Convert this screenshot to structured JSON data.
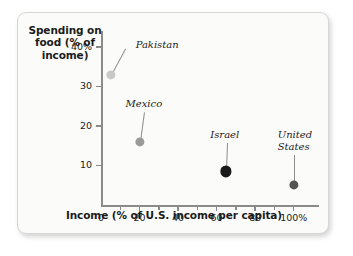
{
  "chart_data": {
    "type": "scatter",
    "title": "",
    "xlabel": "Income (% of U.S. income per capita)",
    "ylabel": "Spending on food (% of income)",
    "ylabel_lines": [
      "Spending on",
      "food (% of",
      "income)"
    ],
    "xlim": [
      0,
      110
    ],
    "ylim": [
      0,
      43
    ],
    "grid": false,
    "legend": "none",
    "x_ticks": [
      {
        "value": 0,
        "label": "0",
        "major": true
      },
      {
        "value": 10,
        "label": "",
        "major": false
      },
      {
        "value": 20,
        "label": "20",
        "major": true
      },
      {
        "value": 30,
        "label": "",
        "major": false
      },
      {
        "value": 40,
        "label": "40",
        "major": true
      },
      {
        "value": 50,
        "label": "",
        "major": false
      },
      {
        "value": 60,
        "label": "60",
        "major": true
      },
      {
        "value": 70,
        "label": "",
        "major": false
      },
      {
        "value": 80,
        "label": "80",
        "major": true
      },
      {
        "value": 90,
        "label": "",
        "major": false
      },
      {
        "value": 100,
        "label": "100%",
        "major": true
      }
    ],
    "y_ticks": [
      {
        "value": 40,
        "label": "40%"
      },
      {
        "value": 30,
        "label": "30"
      },
      {
        "value": 20,
        "label": "20"
      },
      {
        "value": 10,
        "label": "10"
      }
    ],
    "points": [
      {
        "name": "Pakistan",
        "x": 5,
        "y": 33,
        "color": "#c9c9c9",
        "radius": 4.6,
        "label_lines": [
          "Pakistan"
        ]
      },
      {
        "name": "Mexico",
        "x": 20,
        "y": 16,
        "color": "#9a9a9a",
        "radius": 4.6,
        "label_lines": [
          "Mexico"
        ]
      },
      {
        "name": "Israel",
        "x": 65,
        "y": 8.5,
        "color": "#1a1a1a",
        "radius": 5.6,
        "label_lines": [
          "Israel"
        ]
      },
      {
        "name": "United States",
        "x": 100,
        "y": 5,
        "color": "#555555",
        "radius": 4.6,
        "label_lines": [
          "United",
          "States"
        ]
      }
    ]
  },
  "colors": {
    "axis": "#8a8a8a",
    "text": "#1b1b1b",
    "card_background": "#fbfbfa",
    "card_border": "#d8d6d2",
    "leader_line": "#8d8d8d"
  }
}
